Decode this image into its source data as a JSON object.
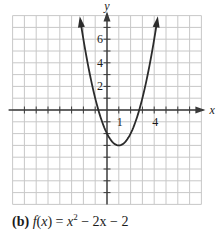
{
  "chart_data": {
    "type": "line",
    "title": "",
    "caption_label": "(b)",
    "caption_function": "f(x) = x² − 2x − 2",
    "caption_parts": {
      "fname": "f",
      "arg": "x",
      "eq": " = ",
      "base": "x",
      "exp": "2",
      "rest": " − 2x − 2"
    },
    "xlabel": "x",
    "ylabel": "y",
    "xlim": [
      -8,
      8
    ],
    "ylim": [
      -8,
      8
    ],
    "grid": true,
    "x_tick_labels": [
      {
        "value": 1,
        "label": "1"
      },
      {
        "value": 4,
        "label": "4"
      }
    ],
    "y_tick_labels": [
      {
        "value": 2,
        "label": "2"
      },
      {
        "value": 4,
        "label": "4"
      },
      {
        "value": 6,
        "label": "6"
      }
    ],
    "series": [
      {
        "name": "f(x) = x^2 - 2x - 2",
        "expression": "x^2 - 2x - 2",
        "x": [
          -2,
          -1.5,
          -1,
          -0.5,
          0,
          0.5,
          1,
          1.5,
          2,
          2.5,
          3,
          3.5,
          4
        ],
        "y": [
          6,
          3.25,
          1,
          -0.75,
          -2,
          -2.75,
          -3,
          -2.75,
          -2,
          -0.75,
          1,
          3.25,
          6
        ],
        "vertex": [
          1,
          -3
        ],
        "arrows_at_ends": true,
        "color": "#2b2b2b"
      }
    ],
    "colors": {
      "grid": "#c8c8c8",
      "axis": "#3a3a3a",
      "curve": "#2b2b2b",
      "text": "#1a1a1a"
    }
  }
}
